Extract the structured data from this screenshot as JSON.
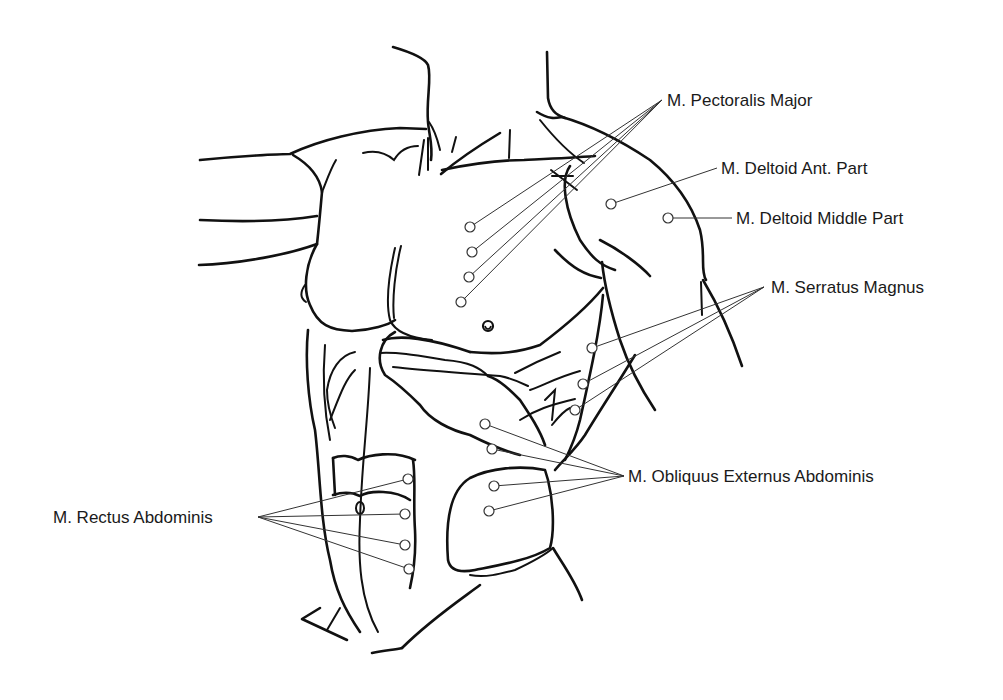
{
  "figure": {
    "title": "",
    "colors": {
      "background": "#ffffff",
      "line": "#111111",
      "text": "#1a1a1a"
    }
  },
  "labels": [
    {
      "id": "pectoralis-major",
      "text": "M. Pectoralis Major",
      "x": 667,
      "y": 92,
      "anchor": [
        662,
        100
      ],
      "points": [
        [
          470,
          227
        ],
        [
          472,
          252
        ],
        [
          469,
          277
        ],
        [
          461,
          302
        ]
      ]
    },
    {
      "id": "deltoid-ant",
      "text": "M. Deltoid Ant. Part",
      "x": 721,
      "y": 160,
      "anchor": [
        717,
        168
      ],
      "points": [
        [
          611,
          204
        ]
      ]
    },
    {
      "id": "deltoid-middle",
      "text": "M. Deltoid Middle Part",
      "x": 736,
      "y": 210,
      "anchor": [
        732,
        218
      ],
      "points": [
        [
          668,
          218
        ]
      ]
    },
    {
      "id": "serratus-magnus",
      "text": "M. Serratus Magnus",
      "x": 771,
      "y": 279,
      "anchor": [
        764,
        287
      ],
      "points": [
        [
          592,
          348
        ],
        [
          583,
          384
        ],
        [
          575,
          410
        ]
      ]
    },
    {
      "id": "obliquus-externus",
      "text": "M. Obliquus Externus Abdominis",
      "x": 628,
      "y": 468,
      "anchor": [
        624,
        476
      ],
      "points": [
        [
          485,
          424
        ],
        [
          492,
          449
        ],
        [
          494,
          486
        ],
        [
          489,
          511
        ]
      ]
    },
    {
      "id": "rectus-abdominis",
      "text": "M. Rectus Abdominis",
      "x": 53,
      "y": 509,
      "anchor": [
        258,
        517
      ],
      "points": [
        [
          408,
          479
        ],
        [
          405,
          514
        ],
        [
          405,
          545
        ],
        [
          409,
          569
        ]
      ]
    }
  ]
}
